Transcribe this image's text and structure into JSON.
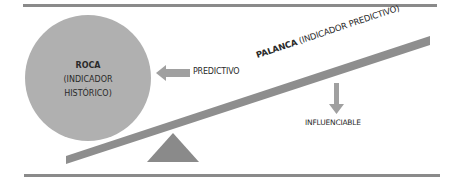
{
  "diagram": {
    "rock": {
      "title": "ROCA",
      "line1": "(INDICADOR",
      "line2": "HISTÓRICO)"
    },
    "arrow_left_label": "PREDICTIVO",
    "lever": {
      "title": "PALANCA",
      "subtitle": "(INDICADOR PREDICTIVO)"
    },
    "arrow_down_label": "INFLUENCIABLE"
  },
  "colors": {
    "shape_gray": "#a8a8a8",
    "lever_gray": "#8e8e8e",
    "fulcrum_gray": "#8a8a8a",
    "rule_gray": "#8a8a8a",
    "text": "#2a2a2a"
  }
}
